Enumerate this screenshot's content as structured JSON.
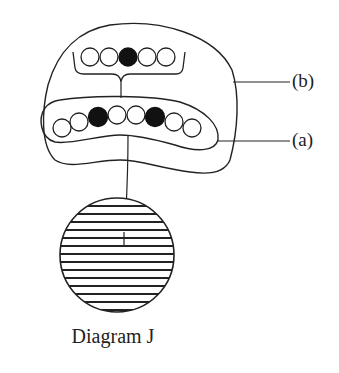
{
  "caption": "Diagram J",
  "labels": {
    "b": "(b)",
    "a": "(a)"
  },
  "colors": {
    "stroke": "#222222",
    "filled_bead": "#111111",
    "background": "#ffffff"
  },
  "structures": {
    "upper_row": {
      "bead_count": 5,
      "beads": [
        "empty",
        "empty",
        "filled",
        "empty",
        "empty"
      ]
    },
    "lower_row": {
      "bead_count": 8,
      "beads": [
        "empty",
        "empty",
        "filled",
        "empty",
        "empty",
        "filled",
        "empty",
        "empty"
      ],
      "pointer_label": "(a)"
    },
    "outer_envelope": {
      "pointer_label": "(b)"
    },
    "sphere": {
      "pattern": "horizontal-stripes"
    }
  }
}
